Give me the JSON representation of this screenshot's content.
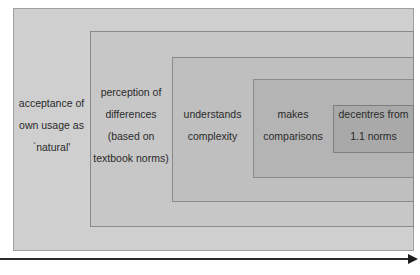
{
  "diagram": {
    "type": "nested-stages",
    "stages": [
      {
        "lines": [
          "acceptance of",
          "own usage as",
          "`natural'"
        ]
      },
      {
        "lines": [
          "perception of",
          "differences",
          "(based on",
          "textbook norms)"
        ]
      },
      {
        "lines": [
          "understands",
          "complexity"
        ]
      },
      {
        "lines": [
          "makes",
          "comparisons"
        ]
      },
      {
        "lines": [
          "decentres from",
          "1.1 norms"
        ]
      }
    ],
    "arrow": {
      "direction": "right",
      "label": ""
    },
    "colors": {
      "stage1": "#cfcfcf",
      "stage2": "#c7c7c7",
      "stage3": "#bfbfbf",
      "stage4": "#b4b4b4",
      "stage5": "#a9a9a9",
      "border": "#8a8a8a",
      "arrow": "#2a2a2a"
    }
  }
}
